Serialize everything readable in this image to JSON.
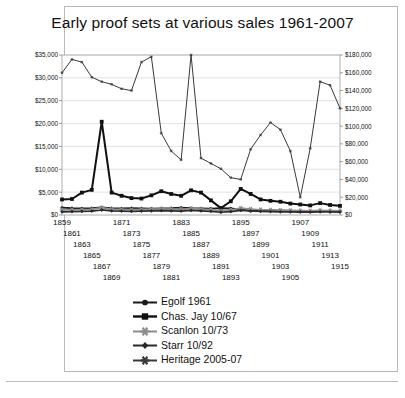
{
  "chart_data": {
    "type": "line",
    "title": "Early proof sets at various sales 1961-2007",
    "xlabel": "",
    "ylabel": "",
    "grid": true,
    "legend_position": "bottom",
    "x": [
      1859,
      1861,
      1863,
      1865,
      1867,
      1869,
      1871,
      1873,
      1875,
      1877,
      1879,
      1881,
      1883,
      1885,
      1887,
      1889,
      1891,
      1893,
      1895,
      1897,
      1899,
      1901,
      1903,
      1905,
      1907,
      1909,
      1911,
      1913,
      1915
    ],
    "axes": {
      "left": {
        "ticks": [
          "$0",
          "$5,000",
          "$10,000",
          "$15,000",
          "$20,000",
          "$25,000",
          "$30,000",
          "$35,000"
        ],
        "min": 0,
        "max": 35000,
        "step": 5000
      },
      "right": {
        "ticks": [
          "$0",
          "$20,000",
          "$40,000",
          "$60,000",
          "$80,000",
          "$100,000",
          "$120,000",
          "$140,000",
          "$160,000",
          "$180,000"
        ],
        "min": 0,
        "max": 180000,
        "step": 20000
      }
    },
    "series": [
      {
        "name": "Egolf 1961",
        "axis": "left",
        "marker": "circle",
        "color": "#1a1a1a",
        "values": [
          1600,
          1500,
          1450,
          1500,
          1700,
          1500,
          1450,
          1500,
          1450,
          1400,
          1450,
          1500,
          1600,
          1500,
          1450,
          1400,
          1500,
          1450,
          1200,
          900,
          1100,
          1000,
          950,
          900,
          850,
          800,
          900,
          850,
          800
        ]
      },
      {
        "name": "Chas. Jay 10/67",
        "axis": "left",
        "marker": "square",
        "color": "#101010",
        "values": [
          3400,
          3500,
          4900,
          5500,
          20400,
          4900,
          4200,
          3700,
          3600,
          4300,
          5200,
          4600,
          4200,
          5400,
          4900,
          3200,
          1500,
          3000,
          5700,
          4600,
          3400,
          3100,
          2900,
          2500,
          2300,
          2100,
          2600,
          2200,
          2000
        ]
      },
      {
        "name": "Scanlon 10/73",
        "axis": "left",
        "marker": "star",
        "color": "#8d8d8d",
        "values": [
          1100,
          1150,
          1200,
          1250,
          1600,
          1300,
          1250,
          1200,
          1250,
          1300,
          1350,
          1300,
          1250,
          1400,
          1300,
          1200,
          900,
          1100,
          1500,
          1300,
          1150,
          1100,
          1050,
          1000,
          950,
          900,
          1000,
          950,
          900
        ]
      },
      {
        "name": "Starr 10/92",
        "axis": "left",
        "marker": "diamond",
        "color": "#2a2a2a",
        "values": [
          700,
          750,
          800,
          850,
          1100,
          900,
          850,
          800,
          850,
          900,
          950,
          900,
          850,
          1000,
          900,
          800,
          600,
          750,
          1000,
          900,
          800,
          750,
          700,
          680,
          650,
          620,
          700,
          660,
          640
        ]
      },
      {
        "name": "Heritage 2005-07",
        "axis": "right",
        "marker": "asterisk",
        "color": "#3a3a3a",
        "values": [
          160000,
          175000,
          172000,
          155000,
          150000,
          147000,
          142000,
          140000,
          172000,
          178000,
          92000,
          72000,
          62000,
          180000,
          64000,
          58000,
          52000,
          42000,
          40000,
          74000,
          90000,
          104000,
          96000,
          72000,
          20000,
          75000,
          150000,
          146000,
          120000
        ]
      }
    ]
  },
  "xtick_labels": [
    "1859",
    "1861",
    "1863",
    "1865",
    "1867",
    "1869",
    "1871",
    "1873",
    "1875",
    "1877",
    "1879",
    "1881",
    "1883",
    "1885",
    "1887",
    "1889",
    "1891",
    "1893",
    "1895",
    "1897",
    "1899",
    "1901",
    "1903",
    "1905",
    "1907",
    "1909",
    "1911",
    "1913",
    "1915"
  ],
  "legend": {
    "items": [
      {
        "label": "Egolf 1961",
        "marker": "circle-marker"
      },
      {
        "label": "Chas. Jay 10/67",
        "marker": "square-marker"
      },
      {
        "label": "Scanlon 10/73",
        "marker": "star-marker"
      },
      {
        "label": "Starr 10/92",
        "marker": "diamond-marker"
      },
      {
        "label": "Heritage 2005-07",
        "marker": "asterisk-marker"
      }
    ]
  }
}
